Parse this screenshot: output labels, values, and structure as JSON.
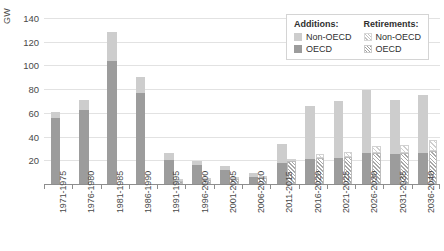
{
  "chart_data": {
    "type": "bar",
    "title": "",
    "subtitle": "",
    "xlabel": "",
    "ylabel": "GW",
    "ylim": [
      0,
      145
    ],
    "yticks": [
      20,
      40,
      60,
      80,
      100,
      120,
      140
    ],
    "grid": true,
    "stacked": true,
    "legend_position": "top-right",
    "categories": [
      "1971-1975",
      "1976-1980",
      "1981-1985",
      "1986-1990",
      "1991-1995",
      "1996-2000",
      "2001-2005",
      "2006-2010",
      "2011-2015",
      "2016-2020",
      "2021-2025",
      "2026-2030",
      "2031-2035",
      "2036-2040"
    ],
    "groups": [
      {
        "name": "Additions",
        "series": [
          {
            "name": "OECD",
            "key": "add-oecd",
            "color": "#9c9c9c",
            "values": [
              56,
              62,
              104,
              77,
              20,
              16,
              12,
              6,
              18,
              21,
              22,
              26,
              25,
              26
            ]
          },
          {
            "name": "Non-OECD",
            "key": "add-nonoecd",
            "color": "#cdcdcd",
            "values": [
              5,
              9,
              24,
              13,
              6,
              3,
              3,
              3,
              16,
              45,
              48,
              53,
              46,
              49
            ]
          }
        ]
      },
      {
        "name": "Retirements",
        "series": [
          {
            "name": "OECD",
            "key": "ret-oecd",
            "color": "#a8a8a8",
            "values": [
              0,
              0,
              0,
              0,
              3,
              4,
              5,
              6,
              19,
              22,
              23,
              26,
              26,
              28
            ]
          },
          {
            "name": "Non-OECD",
            "key": "ret-nonoecd",
            "color": "#cfcfcf",
            "values": [
              0,
              0,
              0,
              0,
              1,
              1,
              1,
              1,
              2,
              3,
              4,
              6,
              7,
              9
            ]
          }
        ]
      }
    ],
    "totals_additions": [
      61,
      71,
      128,
      90,
      26,
      19,
      15,
      9,
      34,
      66,
      70,
      79,
      71,
      75
    ],
    "totals_retirements": [
      0,
      0,
      0,
      0,
      4,
      5,
      6,
      7,
      21,
      25,
      27,
      32,
      33,
      37
    ]
  },
  "legend": {
    "columns": [
      {
        "header": "Additions:",
        "entries": [
          {
            "label": "Non-OECD",
            "swatch": "add-nonoecd"
          },
          {
            "label": "OECD",
            "swatch": "add-oecd"
          }
        ]
      },
      {
        "header": "Retirements:",
        "entries": [
          {
            "label": "Non-OECD",
            "swatch": "ret-nonoecd"
          },
          {
            "label": "OECD",
            "swatch": "ret-oecd"
          }
        ]
      }
    ]
  }
}
